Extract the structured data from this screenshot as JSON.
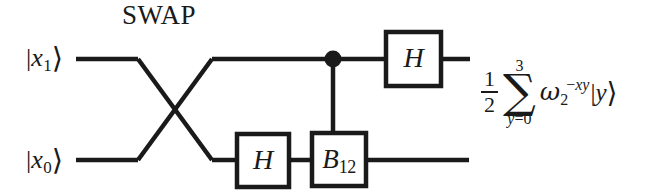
{
  "figure": {
    "type": "quantum-circuit-diagram",
    "swap_label": "SWAP",
    "ink_color": "#1a1a1a",
    "background_color": "#ffffff"
  },
  "wires": [
    {
      "id": "wire-top",
      "input_label": {
        "bra_bar": "|",
        "symbol": "x",
        "subscript": "1",
        "ket_angle": "⟩"
      },
      "y": 59
    },
    {
      "id": "wire-bottom",
      "input_label": {
        "bra_bar": "|",
        "symbol": "x",
        "subscript": "0",
        "ket_angle": "⟩"
      },
      "y": 160
    }
  ],
  "gates": [
    {
      "id": "swap",
      "name": "SWAP",
      "label": "SWAP",
      "kind": "crossing-wires"
    },
    {
      "id": "h-bottom",
      "name": "Hadamard",
      "label": "H",
      "wire": "wire-bottom"
    },
    {
      "id": "b12",
      "name": "B12",
      "label": "B",
      "subscript": "12",
      "wire": "wire-bottom",
      "controlled_by": "wire-top"
    },
    {
      "id": "control-dot",
      "name": "control",
      "label": "",
      "wire": "wire-top"
    },
    {
      "id": "h-top",
      "name": "Hadamard",
      "label": "H",
      "wire": "wire-top"
    }
  ],
  "output_expression": {
    "fraction": {
      "numerator": "1",
      "denominator": "2"
    },
    "sum": {
      "glyph": "∑",
      "upper_limit": "3",
      "lower_limit_var": "y",
      "lower_limit_eq": "=0"
    },
    "omega": {
      "symbol": "ω",
      "subscript": "2",
      "exponent_sign": "−",
      "exponent": "xy"
    },
    "ket": {
      "bra_bar": "|",
      "symbol": "y",
      "ket_angle": "⟩"
    }
  }
}
